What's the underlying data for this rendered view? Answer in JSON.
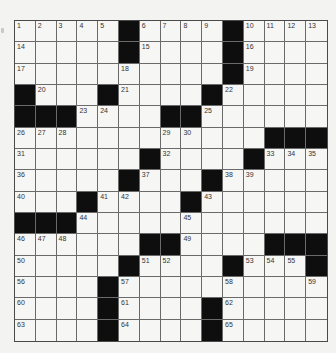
{
  "puzzle": {
    "rows": 15,
    "cols": 15,
    "colors": {
      "background": "#f3f3f2",
      "cell": "#f6f6f5",
      "block": "#0e0e0e",
      "gridline": "#6a6a6a",
      "number": "#333333"
    },
    "layout": [
      "#....#....#....",
      "#....#....#....",
      "#..........#...",
      "##...#.....#...",
      "###.........##.",
      "#..........###.",
      "#.....#....#...",
      "#....#...#.....",
      "#...#....#.....",
      "###............",
      "#.....##....###",
      "#....#....#...#",
      "#...#..........",
      "#...#....#.....",
      "#...#....#....."
    ],
    "grid": [
      [
        "1",
        "2",
        "3",
        "4",
        "5",
        "#",
        "6",
        "7",
        "8",
        "9",
        "#",
        "10",
        "11",
        "12",
        "13"
      ],
      [
        "14",
        "",
        "",
        "",
        "",
        "#",
        "15",
        "",
        "",
        "",
        "#",
        "16",
        "",
        "",
        ""
      ],
      [
        "17",
        "",
        "",
        "",
        "",
        "18",
        "",
        "",
        "",
        "",
        "#",
        "19",
        "",
        "",
        ""
      ],
      [
        "#",
        "20",
        "",
        "",
        "#",
        "21",
        "",
        "",
        "",
        "#",
        "22",
        "",
        "",
        "",
        ""
      ],
      [
        "#",
        "#",
        "#",
        "23",
        "24",
        "",
        "",
        "#",
        "#",
        "25",
        "",
        "",
        "",
        "",
        ""
      ],
      [
        "26",
        "27",
        "28",
        "",
        "",
        "",
        "",
        "29",
        "30",
        "",
        "",
        "",
        "#",
        "#",
        "#"
      ],
      [
        "31",
        "",
        "",
        "",
        "",
        "",
        "#",
        "32",
        "",
        "",
        "",
        "#",
        "33",
        "34",
        "35"
      ],
      [
        "36",
        "",
        "",
        "",
        "",
        "#",
        "37",
        "",
        "",
        "#",
        "38",
        "39",
        "",
        "",
        ""
      ],
      [
        "40",
        "",
        "",
        "#",
        "41",
        "42",
        "",
        "",
        "#",
        "43",
        "",
        "",
        "",
        "",
        ""
      ],
      [
        "#",
        "#",
        "#",
        "44",
        "",
        "",
        "",
        "",
        "45",
        "",
        "",
        "",
        "",
        "",
        ""
      ],
      [
        "46",
        "47",
        "48",
        "",
        "",
        "",
        "#",
        "#",
        "49",
        "",
        "",
        "",
        "#",
        "#",
        "#"
      ],
      [
        "50",
        "",
        "",
        "",
        "",
        "#",
        "51",
        "52",
        "",
        "",
        "#",
        "53",
        "54",
        "55",
        "#"
      ],
      [
        "56",
        "",
        "",
        "",
        "#",
        "57",
        "",
        "",
        "",
        "",
        "58",
        "",
        "",
        "",
        "59"
      ],
      [
        "60",
        "",
        "",
        "",
        "#",
        "61",
        "",
        "",
        "",
        "#",
        "62",
        "",
        "",
        "",
        ""
      ],
      [
        "63",
        "",
        "",
        "",
        "#",
        "64",
        "",
        "",
        "",
        "#",
        "65",
        "",
        "",
        "",
        ""
      ]
    ]
  }
}
